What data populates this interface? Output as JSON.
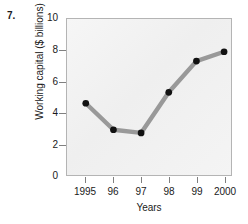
{
  "problem": {
    "number": "7."
  },
  "chart_data": {
    "type": "line",
    "title": "",
    "xlabel": "Years",
    "ylabel": "Working capital ($ billions)",
    "categories": [
      "1995",
      "96",
      "97",
      "98",
      "99",
      "2000"
    ],
    "values": [
      4.6,
      2.9,
      2.7,
      5.3,
      7.3,
      7.9
    ],
    "series": [
      {
        "name": "Working capital",
        "values": [
          4.6,
          2.9,
          2.7,
          5.3,
          7.3,
          7.9
        ]
      }
    ],
    "ylim": [
      0,
      10
    ],
    "yticks": [
      0,
      2,
      4,
      6,
      8,
      10
    ],
    "ytick_labels": [
      "0",
      "2",
      "4",
      "6",
      "8",
      "10"
    ],
    "xtick_labels": [
      "1995",
      "96",
      "97",
      "98",
      "99",
      "2000"
    ],
    "grid": false,
    "legend": false,
    "legend_position": "none",
    "line_color": "#999999",
    "marker_color": "#111111",
    "plot_background": "#f2f2f2",
    "frame_color": "#b4b4b4"
  }
}
